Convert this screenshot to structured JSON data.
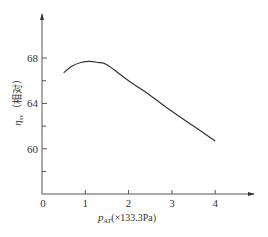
{
  "chart_data": {
    "type": "line",
    "title": "",
    "xlabel": "p_AT(×133.3Pa)",
    "xlabel_main": "p",
    "xlabel_sub": "AT",
    "xlabel_unit": "(×133.3Pa)",
    "ylabel": "η_sv（相对）",
    "ylabel_main": "η",
    "ylabel_sub": "sv",
    "ylabel_unit": "（相对）",
    "xlim": [
      0,
      4.9
    ],
    "ylim": [
      56,
      72
    ],
    "x_ticks": [
      "0",
      "1",
      "2",
      "3",
      "4"
    ],
    "y_ticks_labeled": [
      "60",
      "64",
      "68"
    ],
    "y_ticks_minor": [
      58,
      62,
      66
    ],
    "grid": false,
    "legend": null,
    "series": [
      {
        "name": "η_sv",
        "x": [
          0.5,
          0.7,
          0.9,
          1.1,
          1.3,
          1.5,
          2.0,
          2.5,
          3.0,
          3.5,
          4.0
        ],
        "values": [
          66.7,
          67.3,
          67.6,
          67.7,
          67.6,
          67.4,
          66.0,
          64.7,
          63.3,
          62.0,
          60.7
        ]
      }
    ]
  }
}
